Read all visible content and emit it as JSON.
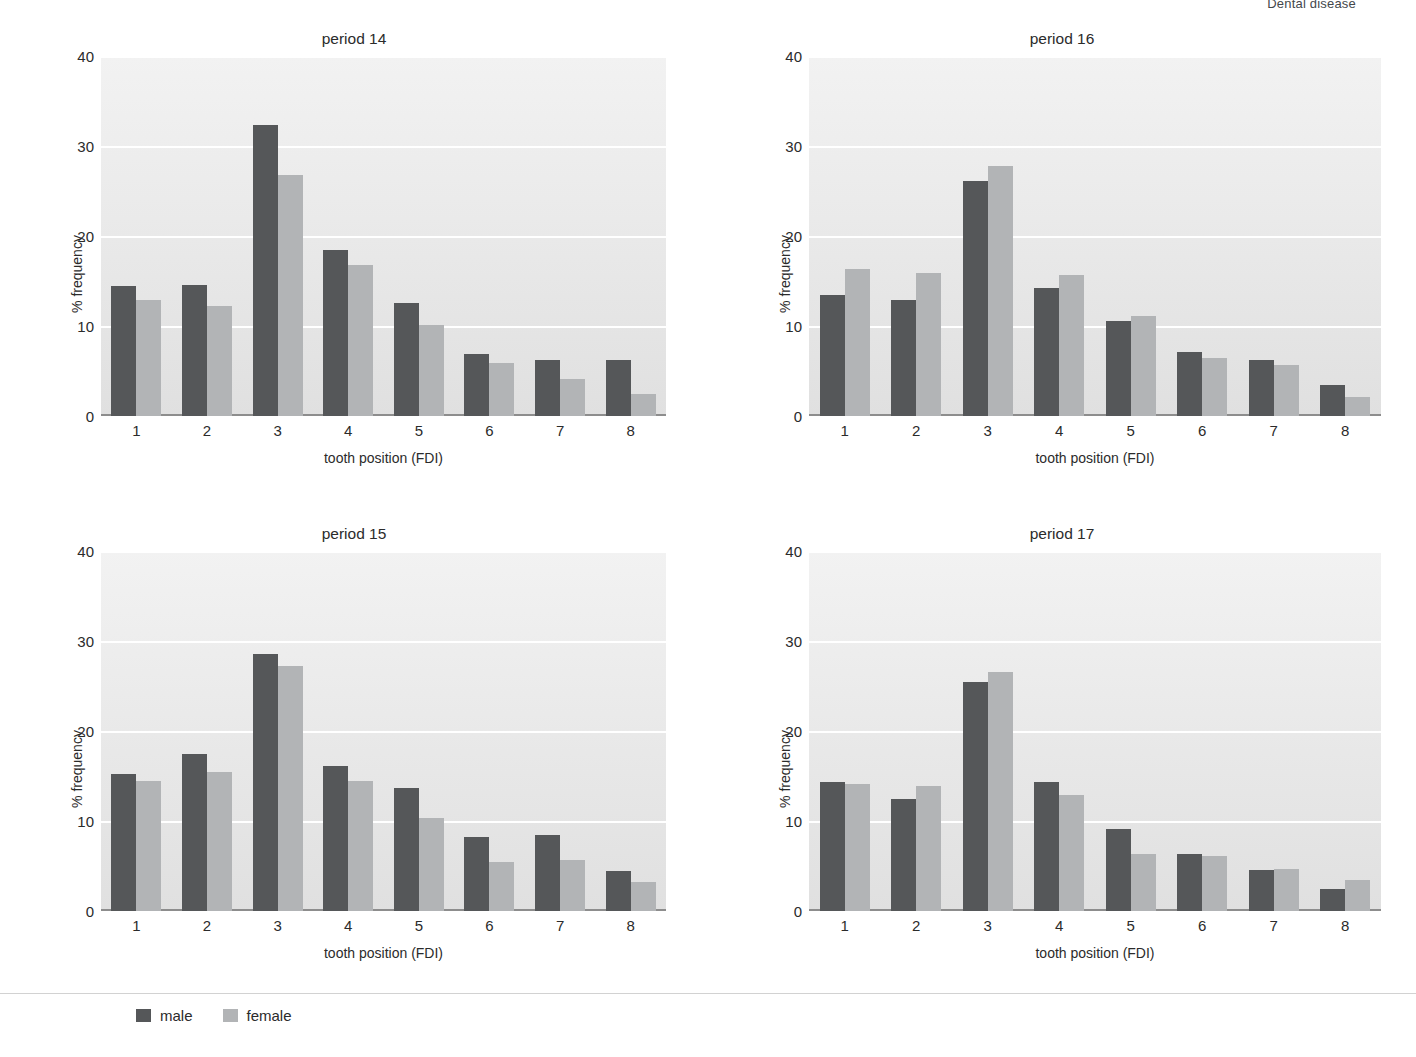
{
  "running_head": "Dental disease",
  "legend": {
    "items": [
      {
        "label": "male",
        "color": "#555759",
        "swatch": "legend-swatch-male"
      },
      {
        "label": "female",
        "color": "#b2b4b6",
        "swatch": "legend-swatch-female"
      }
    ]
  },
  "axis": {
    "ylabel": "% frequency",
    "xlabel": "tooth position (FDI)",
    "yticks": [
      "0",
      "10",
      "20",
      "30",
      "40"
    ],
    "xticks": [
      "1",
      "2",
      "3",
      "4",
      "5",
      "6",
      "7",
      "8"
    ]
  },
  "chart_data": [
    {
      "type": "bar",
      "title": "period 14",
      "xlabel": "tooth position (FDI)",
      "ylabel": "% frequency",
      "categories": [
        "1",
        "2",
        "3",
        "4",
        "5",
        "6",
        "7",
        "8"
      ],
      "ylim": [
        0,
        40
      ],
      "yticks": [
        0,
        10,
        20,
        30,
        40
      ],
      "grid": true,
      "legend_position": "bottom",
      "series": [
        {
          "name": "male",
          "color": "#555759",
          "values": [
            14.5,
            14.6,
            32.3,
            18.5,
            12.6,
            6.9,
            6.2,
            6.2
          ]
        },
        {
          "name": "female",
          "color": "#b2b4b6",
          "values": [
            12.9,
            12.2,
            26.8,
            16.8,
            10.1,
            5.9,
            4.1,
            2.5
          ]
        }
      ]
    },
    {
      "type": "bar",
      "title": "period 16",
      "xlabel": "tooth position (FDI)",
      "ylabel": "% frequency",
      "categories": [
        "1",
        "2",
        "3",
        "4",
        "5",
        "6",
        "7",
        "8"
      ],
      "ylim": [
        0,
        40
      ],
      "yticks": [
        0,
        10,
        20,
        30,
        40
      ],
      "grid": true,
      "legend_position": "bottom",
      "series": [
        {
          "name": "male",
          "color": "#555759",
          "values": [
            13.5,
            12.9,
            26.1,
            14.2,
            10.6,
            7.1,
            6.2,
            3.5
          ]
        },
        {
          "name": "female",
          "color": "#b2b4b6",
          "values": [
            16.3,
            15.9,
            27.8,
            15.7,
            11.1,
            6.4,
            5.7,
            2.1
          ]
        }
      ]
    },
    {
      "type": "bar",
      "title": "period 15",
      "xlabel": "tooth position (FDI)",
      "ylabel": "% frequency",
      "categories": [
        "1",
        "2",
        "3",
        "4",
        "5",
        "6",
        "7",
        "8"
      ],
      "ylim": [
        0,
        40
      ],
      "yticks": [
        0,
        10,
        20,
        30,
        40
      ],
      "grid": true,
      "legend_position": "bottom",
      "series": [
        {
          "name": "male",
          "color": "#555759",
          "values": [
            15.2,
            17.5,
            28.6,
            16.1,
            13.7,
            8.2,
            8.4,
            4.4
          ]
        },
        {
          "name": "female",
          "color": "#b2b4b6",
          "values": [
            14.5,
            15.4,
            27.2,
            14.4,
            10.3,
            5.4,
            5.7,
            3.2
          ]
        }
      ]
    },
    {
      "type": "bar",
      "title": "period 17",
      "xlabel": "tooth position (FDI)",
      "ylabel": "% frequency",
      "categories": [
        "1",
        "2",
        "3",
        "4",
        "5",
        "6",
        "7",
        "8"
      ],
      "ylim": [
        0,
        40
      ],
      "yticks": [
        0,
        10,
        20,
        30,
        40
      ],
      "grid": true,
      "legend_position": "bottom",
      "series": [
        {
          "name": "male",
          "color": "#555759",
          "values": [
            14.3,
            12.4,
            25.4,
            14.3,
            9.1,
            6.3,
            4.6,
            2.4
          ]
        },
        {
          "name": "female",
          "color": "#b2b4b6",
          "values": [
            14.1,
            13.9,
            26.6,
            12.9,
            6.3,
            6.1,
            4.7,
            3.5
          ]
        }
      ]
    }
  ]
}
